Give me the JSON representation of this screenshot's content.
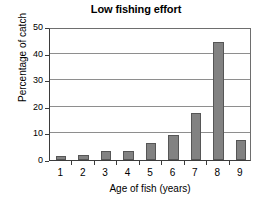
{
  "chart_data": {
    "type": "bar",
    "title": "Low fishing effort",
    "xlabel": "Age of fish (years)",
    "ylabel": "Percentage of catch",
    "categories": [
      "1",
      "2",
      "3",
      "4",
      "5",
      "6",
      "7",
      "8",
      "9"
    ],
    "values": [
      1.5,
      1.8,
      3.5,
      3.5,
      6.5,
      9.5,
      17.5,
      44.5,
      7.5
    ],
    "ylim": [
      0,
      50
    ],
    "y_ticks": [
      0,
      10,
      20,
      30,
      40,
      50
    ],
    "y_tick_labels": [
      "0",
      "10",
      "20",
      "30",
      "40",
      "50"
    ],
    "grid": true,
    "legend": "none",
    "bar_color": "#828282",
    "bar_border_color": "#565656",
    "axis_color": "#3b3b3b",
    "grid_color": "#8e8e8e",
    "text_color": "#000000",
    "background": "#ffffff"
  }
}
